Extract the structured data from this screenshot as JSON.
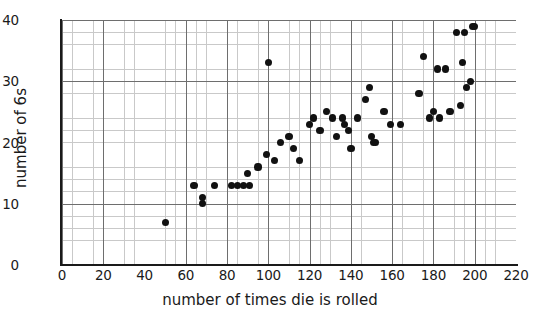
{
  "chart_data": {
    "type": "scatter",
    "title": "",
    "xlabel": "number of times die is rolled",
    "ylabel": "number of 6s",
    "xlim": [
      0,
      220
    ],
    "ylim": [
      0,
      40
    ],
    "x_ticks": [
      0,
      20,
      40,
      60,
      80,
      100,
      120,
      140,
      160,
      180,
      200,
      220
    ],
    "y_ticks": [
      0,
      10,
      20,
      30,
      40
    ],
    "x_minor_step": 5,
    "y_minor_step": 2,
    "grid": true,
    "legend": "none",
    "marker": {
      "shape": "circle",
      "color": "#111111",
      "size": 7
    },
    "points": [
      {
        "x": 50,
        "y": 7
      },
      {
        "x": 64,
        "y": 13
      },
      {
        "x": 68,
        "y": 11
      },
      {
        "x": 68,
        "y": 10
      },
      {
        "x": 74,
        "y": 13
      },
      {
        "x": 82,
        "y": 13
      },
      {
        "x": 85,
        "y": 13
      },
      {
        "x": 88,
        "y": 13
      },
      {
        "x": 90,
        "y": 15
      },
      {
        "x": 91,
        "y": 13
      },
      {
        "x": 95,
        "y": 16
      },
      {
        "x": 99,
        "y": 18
      },
      {
        "x": 100,
        "y": 33
      },
      {
        "x": 103,
        "y": 17
      },
      {
        "x": 106,
        "y": 20
      },
      {
        "x": 110,
        "y": 21
      },
      {
        "x": 112,
        "y": 19
      },
      {
        "x": 115,
        "y": 17
      },
      {
        "x": 120,
        "y": 23
      },
      {
        "x": 122,
        "y": 24
      },
      {
        "x": 125,
        "y": 22
      },
      {
        "x": 128,
        "y": 25
      },
      {
        "x": 131,
        "y": 24
      },
      {
        "x": 133,
        "y": 21
      },
      {
        "x": 136,
        "y": 24
      },
      {
        "x": 137,
        "y": 23
      },
      {
        "x": 139,
        "y": 22
      },
      {
        "x": 140,
        "y": 19
      },
      {
        "x": 143,
        "y": 24
      },
      {
        "x": 147,
        "y": 27
      },
      {
        "x": 149,
        "y": 29
      },
      {
        "x": 150,
        "y": 21
      },
      {
        "x": 151,
        "y": 20
      },
      {
        "x": 152,
        "y": 20
      },
      {
        "x": 156,
        "y": 25
      },
      {
        "x": 159,
        "y": 23
      },
      {
        "x": 164,
        "y": 23
      },
      {
        "x": 173,
        "y": 28
      },
      {
        "x": 175,
        "y": 34
      },
      {
        "x": 178,
        "y": 24
      },
      {
        "x": 180,
        "y": 25
      },
      {
        "x": 182,
        "y": 32
      },
      {
        "x": 183,
        "y": 24
      },
      {
        "x": 186,
        "y": 32
      },
      {
        "x": 188,
        "y": 25
      },
      {
        "x": 191,
        "y": 38
      },
      {
        "x": 193,
        "y": 26
      },
      {
        "x": 194,
        "y": 33
      },
      {
        "x": 195,
        "y": 38
      },
      {
        "x": 196,
        "y": 29
      },
      {
        "x": 198,
        "y": 30
      },
      {
        "x": 199,
        "y": 39
      },
      {
        "x": 200,
        "y": 39
      }
    ]
  },
  "axes": {
    "x_tick_labels": [
      "0",
      "20",
      "40",
      "60",
      "80",
      "100",
      "120",
      "140",
      "160",
      "180",
      "200",
      "220"
    ],
    "y_tick_labels": [
      "0",
      "10",
      "20",
      "30",
      "40"
    ],
    "x_title": "number of times die is rolled",
    "y_title": "number of 6s"
  }
}
